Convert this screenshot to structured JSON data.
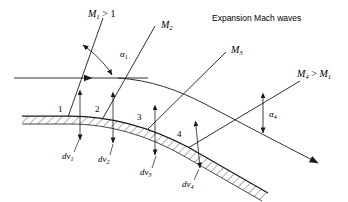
{
  "figure": {
    "title": "Expansion Mach waves",
    "background_color": "#ffffff",
    "line_color": "#1a1a1a",
    "type": "schematic-diagram"
  },
  "wave_labels": {
    "m1": {
      "base": "M",
      "sub": "1",
      "rel": " > 1"
    },
    "m2": {
      "base": "M",
      "sub": "2",
      "rel": ""
    },
    "m3": {
      "base": "M",
      "sub": "3",
      "rel": ""
    },
    "m4": {
      "base": "M",
      "sub": "4",
      "rel": " > ",
      "base2": "M",
      "sub2": "1"
    }
  },
  "angle_labels": {
    "alpha1": {
      "base": "α",
      "sub": "1"
    },
    "alpha4": {
      "base": "α",
      "sub": "4"
    }
  },
  "wall_points": [
    {
      "label": "1"
    },
    {
      "label": "2"
    },
    {
      "label": "3"
    },
    {
      "label": "4"
    }
  ],
  "deflection_labels": [
    {
      "base": "dν",
      "sub": "1"
    },
    {
      "base": "dν",
      "sub": "2"
    },
    {
      "base": "dν",
      "sub": "3"
    },
    {
      "base": "dν",
      "sub": "4"
    }
  ]
}
